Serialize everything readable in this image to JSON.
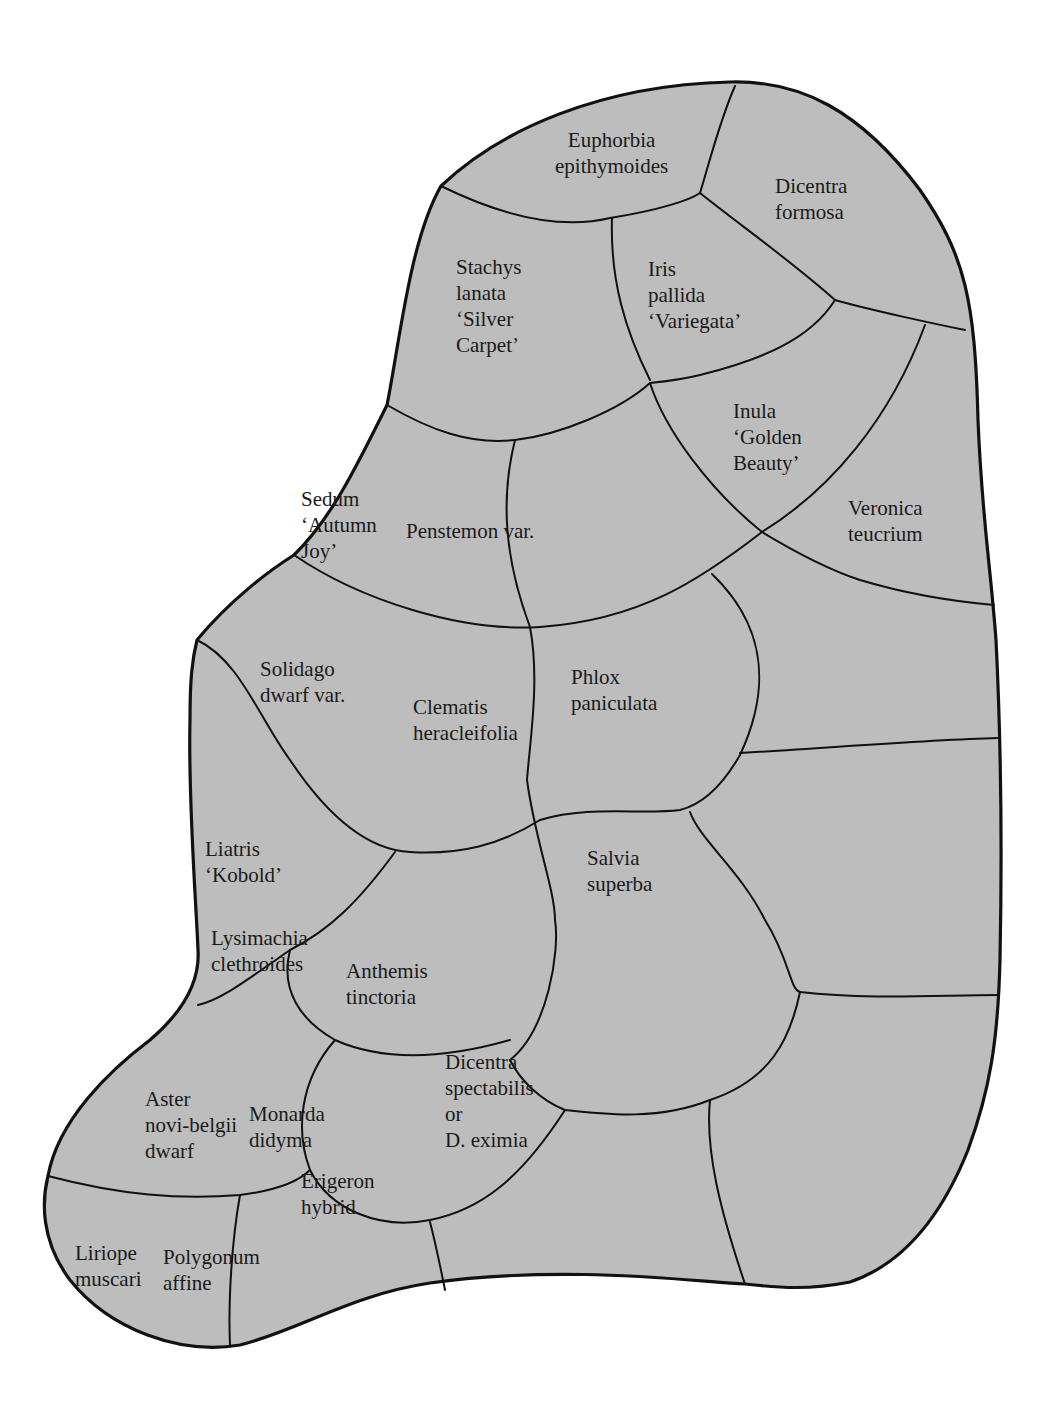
{
  "diagram": {
    "type": "garden-planting-plan",
    "colors": {
      "bed_fill": "#bdbdbd",
      "outline": "#111111",
      "background": "#ffffff",
      "text": "#1a1a1a"
    },
    "plants": [
      {
        "id": "euphorbia",
        "lines": [
          "Euphorbia",
          "epithymoides"
        ]
      },
      {
        "id": "dicentra-formosa",
        "lines": [
          "Dicentra",
          "formosa"
        ]
      },
      {
        "id": "stachys",
        "lines": [
          "Stachys",
          "lanata",
          "‘Silver",
          "Carpet’"
        ]
      },
      {
        "id": "iris",
        "lines": [
          "Iris",
          "pallida",
          "‘Variegata’"
        ]
      },
      {
        "id": "inula",
        "lines": [
          "Inula",
          "‘Golden",
          "Beauty’"
        ]
      },
      {
        "id": "sedum",
        "lines": [
          "Sedum",
          "‘Autumn",
          "Joy’"
        ]
      },
      {
        "id": "penstemon",
        "lines": [
          "Penstemon var."
        ]
      },
      {
        "id": "veronica",
        "lines": [
          "Veronica",
          "teucrium"
        ]
      },
      {
        "id": "solidago",
        "lines": [
          "Solidago",
          "dwarf var."
        ]
      },
      {
        "id": "clematis",
        "lines": [
          "Clematis",
          "heracleifolia"
        ]
      },
      {
        "id": "phlox",
        "lines": [
          "Phlox",
          "paniculata"
        ]
      },
      {
        "id": "liatris",
        "lines": [
          "Liatris",
          "‘Kobold’"
        ]
      },
      {
        "id": "salvia",
        "lines": [
          "Salvia",
          "superba"
        ]
      },
      {
        "id": "lysimachia",
        "lines": [
          "Lysimachia",
          "clethroides"
        ]
      },
      {
        "id": "anthemis",
        "lines": [
          "Anthemis",
          "tinctoria"
        ]
      },
      {
        "id": "dicentra-spectabilis",
        "lines": [
          "Dicentra",
          "spectabilis",
          "or",
          "D. eximia"
        ]
      },
      {
        "id": "aster",
        "lines": [
          "Aster",
          "novi-belgii",
          "dwarf"
        ]
      },
      {
        "id": "monarda",
        "lines": [
          "Monarda",
          "didyma"
        ]
      },
      {
        "id": "erigeron",
        "lines": [
          "Erigeron",
          "hybrid"
        ]
      },
      {
        "id": "liriope",
        "lines": [
          "Liriope",
          "muscari"
        ]
      },
      {
        "id": "polygonum",
        "lines": [
          "Polygonum",
          "affine"
        ]
      }
    ]
  }
}
